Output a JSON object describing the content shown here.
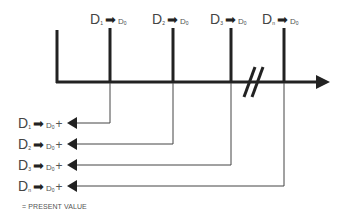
{
  "diagram": {
    "timeline": {
      "break_marker": "//",
      "periods": [
        {
          "label": "D",
          "sub": "1",
          "target": "D",
          "target_sub": "0"
        },
        {
          "label": "D",
          "sub": "2",
          "target": "D",
          "target_sub": "0"
        },
        {
          "label": "D",
          "sub": "3",
          "target": "D",
          "target_sub": "0"
        },
        {
          "label": "D",
          "sub": "n",
          "target": "D",
          "target_sub": "0"
        }
      ]
    },
    "summation": [
      {
        "label": "D",
        "sub": "1",
        "target": "D",
        "target_sub": "0",
        "op": "+"
      },
      {
        "label": "D",
        "sub": "2",
        "target": "D",
        "target_sub": "0",
        "op": "+"
      },
      {
        "label": "D",
        "sub": "3",
        "target": "D",
        "target_sub": "0",
        "op": "+"
      },
      {
        "label": "D",
        "sub": "n",
        "target": "D",
        "target_sub": "0",
        "op": "+"
      }
    ],
    "arrow_glyph": "➡",
    "footer": "= PRESENT VALUE"
  }
}
